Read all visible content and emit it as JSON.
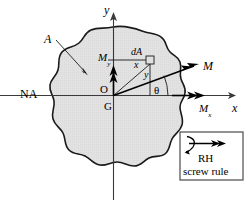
{
  "figure": {
    "background": "#ffffff",
    "section_fill": "#e2e2e2",
    "section_stroke": "#1a1a1a",
    "axis_color": "#3a3a3a",
    "vector_color": "#000000"
  },
  "axes": {
    "y_label": "y",
    "x_label": "x",
    "origin_label": "O",
    "centroid_label": "G",
    "neutral_axis_label": "NA"
  },
  "labels": {
    "area_label": "A",
    "element_label": "dA",
    "element_x": "x",
    "element_y": "y",
    "angle_label": "θ"
  },
  "vectors": {
    "moment_resultant": "M",
    "moment_x": "M",
    "moment_x_sub": "x",
    "moment_y": "M",
    "moment_y_sub": "y"
  },
  "legend": {
    "line1": "RH",
    "line2": "screw rule",
    "curl_icon": "curved-rotation-arrow-icon",
    "double_arrow_icon": "double-arrowhead-vector-icon"
  }
}
